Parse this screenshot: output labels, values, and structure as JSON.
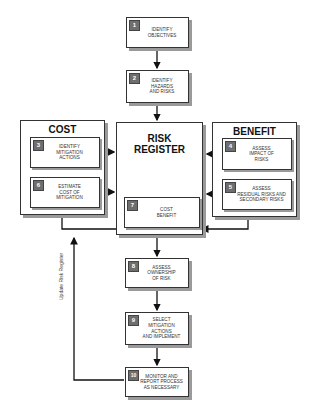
{
  "diagram": {
    "steps": [
      {
        "id": "1",
        "label": "Identify\nObjectives"
      },
      {
        "id": "2",
        "label": "Identify\nHazards\nand Risks"
      },
      {
        "id": "3",
        "label": "Identify\nMitigation\nActions"
      },
      {
        "id": "4",
        "label": "Assess\nImpact of\nRisks"
      },
      {
        "id": "5",
        "label": "Assess\nResidual Risks and\nSecondary Risks"
      },
      {
        "id": "6",
        "label": "Estimate\nCost of\nMitigation"
      },
      {
        "id": "7",
        "label": "Cost\nBenefit"
      },
      {
        "id": "8",
        "label": "Assess\nOwnership\nof Risk"
      },
      {
        "id": "9",
        "label": "Select\nMitigation Actions\nand Implement"
      },
      {
        "id": "10",
        "label": "Monitor and\nReport Process\nas Necessary"
      }
    ],
    "groups": {
      "cost": "COST",
      "register": "RISK\nREGISTER",
      "benefit": "BENEFIT"
    },
    "feedback_label": "Update Risk Register"
  }
}
